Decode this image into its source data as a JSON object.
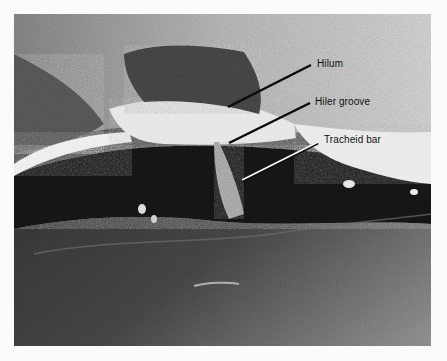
{
  "figure": {
    "labels": [
      {
        "id": "hilum",
        "text": "Hilum"
      },
      {
        "id": "hiler-groove",
        "text": "Hiler groove"
      },
      {
        "id": "tracheid-bar",
        "text": "Tracheid bar"
      }
    ],
    "colors": {
      "background": "#fbfbfb",
      "label_text": "#111111",
      "leader_dark": "#0a0a0a",
      "leader_light": "#ffffff"
    }
  }
}
